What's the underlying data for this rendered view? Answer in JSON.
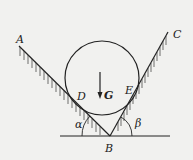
{
  "diagram": {
    "type": "physics-free-body",
    "labels": {
      "A": "A",
      "B": "B",
      "C": "C",
      "D": "D",
      "E": "E",
      "G": "G",
      "alpha": "α",
      "beta": "β"
    },
    "colors": {
      "ink": "#222222",
      "background": "#f1f1ef"
    }
  }
}
